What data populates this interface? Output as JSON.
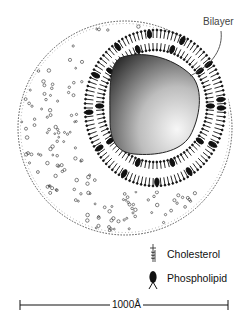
{
  "diagram": {
    "labels": {
      "bilayer": "Bilayer"
    },
    "legend": [
      {
        "icon": "cholesterol-icon",
        "label": "Cholesterol"
      },
      {
        "icon": "phospholipid-icon",
        "label": "Phospholipid"
      }
    ],
    "scale_bar": {
      "label": "1000Å"
    },
    "colors": {
      "ink": "#111111",
      "core_dark": "#3a3a3a",
      "core_light": "#f4f4f4",
      "background": "#ffffff"
    }
  }
}
